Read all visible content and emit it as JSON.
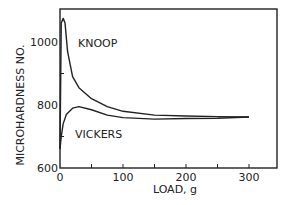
{
  "chart_data": {
    "type": "line",
    "title": "",
    "xlabel": "LOAD, g",
    "ylabel": "MICROHARDNESS NO.",
    "xlim": [
      0,
      340
    ],
    "ylim": [
      600,
      1100
    ],
    "x_ticks": [
      "0",
      "100",
      "200",
      "300"
    ],
    "y_ticks": [
      "600",
      "800",
      "1000"
    ],
    "grid": false,
    "legend": "inline labels",
    "series": [
      {
        "name": "KNOOP",
        "x": [
          0,
          2,
          5,
          8,
          12,
          20,
          30,
          50,
          75,
          100,
          150,
          200,
          250,
          300
        ],
        "values": [
          660,
          1060,
          1075,
          1060,
          970,
          890,
          855,
          820,
          795,
          780,
          768,
          765,
          763,
          762
        ]
      },
      {
        "name": "VICKERS",
        "x": [
          0,
          2,
          5,
          10,
          20,
          30,
          50,
          75,
          100,
          150,
          200,
          250,
          300
        ],
        "values": [
          660,
          700,
          740,
          770,
          790,
          795,
          785,
          768,
          760,
          755,
          757,
          758,
          762
        ]
      }
    ]
  }
}
